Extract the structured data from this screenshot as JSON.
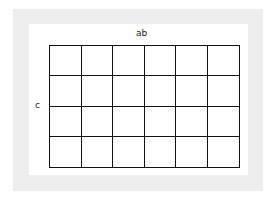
{
  "diagram": {
    "type": "karnaugh-map",
    "top_label": "ab",
    "left_label": "c",
    "rows": 4,
    "columns": 6,
    "cells": [
      [
        "",
        "",
        "",
        "",
        "",
        ""
      ],
      [
        "",
        "",
        "",
        "",
        "",
        ""
      ],
      [
        "",
        "",
        "",
        "",
        "",
        ""
      ],
      [
        "",
        "",
        "",
        "",
        "",
        ""
      ]
    ],
    "colors": {
      "frame": "#eeeeee",
      "background": "#ffffff",
      "grid_line": "#111111"
    }
  }
}
